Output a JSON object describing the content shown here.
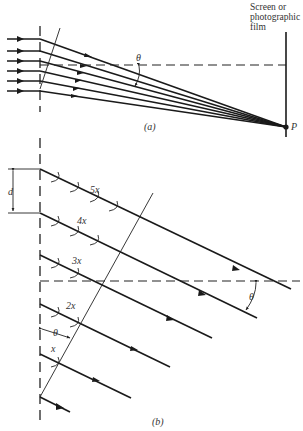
{
  "figure_a": {
    "caption": "(a)",
    "screen_label_line1": "Screen or",
    "screen_label_line2": "photographic",
    "screen_label_line3": "film",
    "angle_label": "θ",
    "point_label": "P"
  },
  "figure_b": {
    "caption": "(b)",
    "spacing_label": "d",
    "angle_label_right": "θ",
    "angle_label_left": "θ",
    "path_labels": [
      "5x",
      "4x",
      "3x",
      "2x",
      "x"
    ]
  },
  "colors": {
    "ink": "#1a1a1a",
    "background": "#ffffff"
  }
}
